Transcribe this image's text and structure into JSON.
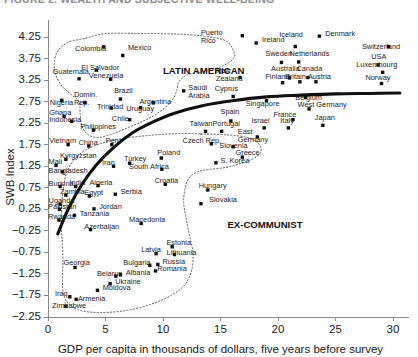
{
  "figure": {
    "cropped_header_text": "FIGURE 2. WEALTH AND SUBJECTIVE WELL-BEING",
    "background_color": "#ffffff",
    "point_color": "#111111",
    "trend_color": "#101010",
    "hull_color": "#5a5a5a"
  },
  "chart_data": {
    "type": "scatter",
    "title": "",
    "xlabel": "GDP per capita in thousands of dollars, five years before survey",
    "ylabel": "SWB Index",
    "xlim": [
      0,
      31
    ],
    "ylim": [
      -2.25,
      4.45
    ],
    "grid": false,
    "legend": "none",
    "xticks": [
      0,
      5,
      10,
      15,
      20,
      25,
      30
    ],
    "xtick_labels": [
      "0",
      "5",
      "10",
      "15",
      "20",
      "25",
      "30"
    ],
    "yticks": [
      4.25,
      3.75,
      3.25,
      2.75,
      2.25,
      1.75,
      1.25,
      0.75,
      0.25,
      -0.25,
      -0.75,
      -1.25,
      -1.75,
      -2.25
    ],
    "ytick_labels": [
      "4.25",
      "3.75",
      "3.25",
      "2.75",
      "2.25",
      "1.75",
      "1.25",
      "0.75",
      "0.25",
      "−0.25",
      "−0.75",
      "−1.25",
      "−1.75",
      "−2.25"
    ],
    "annotations": [
      {
        "text": "LATIN AMERICAN",
        "x": 10.0,
        "y": 3.4
      },
      {
        "text": "EX-COMMUNIST",
        "x": 15.6,
        "y": -0.18
      }
    ],
    "points": [
      {
        "label": "Colombia",
        "x": 4.85,
        "y": 4.02,
        "lx": 2.35,
        "ly": 3.93
      },
      {
        "label": "Mexico",
        "x": 6.5,
        "y": 3.82,
        "lx": 6.95,
        "ly": 3.95
      },
      {
        "label": "Puerto Rico",
        "x": 16.9,
        "y": 4.28,
        "lx": 13.3,
        "ly": 4.3
      },
      {
        "label": "Ireland",
        "x": 18.1,
        "y": 4.11,
        "lx": 18.6,
        "ly": 4.13
      },
      {
        "label": "Iceland",
        "x": 21.5,
        "y": 4.03,
        "lx": 20.1,
        "ly": 4.24
      },
      {
        "label": "Denmark",
        "x": 23.6,
        "y": 4.27,
        "lx": 24.1,
        "ly": 4.28
      },
      {
        "label": "Switzerland",
        "x": 29.6,
        "y": 4.03,
        "lx": 27.3,
        "ly": 3.96
      },
      {
        "label": "Sweden",
        "x": 20.3,
        "y": 3.66,
        "lx": 18.9,
        "ly": 3.8
      },
      {
        "label": "Netherlands",
        "x": 21.8,
        "y": 3.67,
        "lx": 21.0,
        "ly": 3.81
      },
      {
        "label": "USA",
        "x": 28.7,
        "y": 3.6,
        "lx": 28.1,
        "ly": 3.74
      },
      {
        "label": "Luxembourg",
        "x": 29.1,
        "y": 3.43,
        "lx": 26.8,
        "ly": 3.56
      },
      {
        "label": "El Salvador",
        "x": 4.2,
        "y": 3.48,
        "lx": 2.9,
        "ly": 3.48
      },
      {
        "label": "Venezuela",
        "x": 5.45,
        "y": 3.27,
        "lx": 3.55,
        "ly": 3.3
      },
      {
        "label": "Guatemala",
        "x": 2.7,
        "y": 3.28,
        "lx": 0.4,
        "ly": 3.39
      },
      {
        "label": "Australia",
        "x": 21.0,
        "y": 3.3,
        "lx": 19.4,
        "ly": 3.46
      },
      {
        "label": "Canada",
        "x": 22.6,
        "y": 3.31,
        "lx": 21.6,
        "ly": 3.45
      },
      {
        "label": "Britain",
        "x": 21.9,
        "y": 3.21,
        "lx": 20.6,
        "ly": 3.27
      },
      {
        "label": "Austria",
        "x": 23.3,
        "y": 3.21,
        "lx": 22.6,
        "ly": 3.27
      },
      {
        "label": "Finland",
        "x": 20.4,
        "y": 3.19,
        "lx": 18.9,
        "ly": 3.27
      },
      {
        "label": "New Zealand",
        "x": 16.7,
        "y": 3.31,
        "lx": 14.6,
        "ly": 3.42
      },
      {
        "label": "Norway",
        "x": 29.0,
        "y": 3.17,
        "lx": 27.6,
        "ly": 3.25
      },
      {
        "label": "Saudi Arabia",
        "x": 11.8,
        "y": 3.0,
        "lx": 12.2,
        "ly": 3.02
      },
      {
        "label": "Cyprus",
        "x": 16.1,
        "y": 2.87,
        "lx": 14.5,
        "ly": 2.99
      },
      {
        "label": "Belgium",
        "x": 22.4,
        "y": 2.85,
        "lx": 21.5,
        "ly": 2.79
      },
      {
        "label": "Singapore",
        "x": 19.0,
        "y": 2.77,
        "lx": 17.2,
        "ly": 2.65
      },
      {
        "label": "Brazil",
        "x": 6.3,
        "y": 2.81,
        "lx": 5.75,
        "ly": 2.95
      },
      {
        "label": "Nigeria",
        "x": 1.2,
        "y": 2.78,
        "lx": 0.15,
        "ly": 2.68
      },
      {
        "label": "Domin. Rep.",
        "x": 3.2,
        "y": 2.73,
        "lx": 2.25,
        "ly": 2.85
      },
      {
        "label": "Argentina",
        "x": 9.15,
        "y": 2.72,
        "lx": 7.95,
        "ly": 2.69
      },
      {
        "label": "Trinidad",
        "x": 5.5,
        "y": 2.6,
        "lx": 4.25,
        "ly": 2.57
      },
      {
        "label": "Uruguay",
        "x": 8.05,
        "y": 2.61,
        "lx": 6.8,
        "ly": 2.54
      },
      {
        "label": "West Germany",
        "x": 22.7,
        "y": 2.58,
        "lx": 21.7,
        "ly": 2.62
      },
      {
        "label": "Ghana",
        "x": 1.4,
        "y": 2.41,
        "lx": 0.1,
        "ly": 2.43
      },
      {
        "label": "Indonesia",
        "x": 2.05,
        "y": 2.29,
        "lx": 0.1,
        "ly": 2.28
      },
      {
        "label": "Chile",
        "x": 7.1,
        "y": 2.33,
        "lx": 5.55,
        "ly": 2.3
      },
      {
        "label": "France",
        "x": 21.3,
        "y": 2.33,
        "lx": 19.6,
        "ly": 2.4
      },
      {
        "label": "Spain",
        "x": 15.9,
        "y": 2.3,
        "lx": 15.0,
        "ly": 2.47
      },
      {
        "label": "Japan",
        "x": 23.9,
        "y": 2.2,
        "lx": 23.2,
        "ly": 2.33
      },
      {
        "label": "Israel",
        "x": 18.8,
        "y": 2.14,
        "lx": 17.7,
        "ly": 2.25
      },
      {
        "label": "Italy",
        "x": 20.9,
        "y": 2.14,
        "lx": 20.2,
        "ly": 2.25
      },
      {
        "label": "Philippines",
        "x": 3.95,
        "y": 2.09,
        "lx": 2.8,
        "ly": 2.12
      },
      {
        "label": "Taiwan",
        "x": 13.7,
        "y": 2.06,
        "lx": 12.3,
        "ly": 2.18
      },
      {
        "label": "Portugal",
        "x": 15.1,
        "y": 2.06,
        "lx": 14.3,
        "ly": 2.18
      },
      {
        "label": "East Germany",
        "x": 18.2,
        "y": 1.93,
        "lx": 16.5,
        "ly": 1.99
      },
      {
        "label": "Vietnam",
        "x": 1.75,
        "y": 1.75,
        "lx": 0.1,
        "ly": 1.78
      },
      {
        "label": "China",
        "x": 3.55,
        "y": 1.72,
        "lx": 2.65,
        "ly": 1.75
      },
      {
        "label": "Peru",
        "x": 5.55,
        "y": 1.75,
        "lx": 5.0,
        "ly": 1.79
      },
      {
        "label": "Czech Rep.",
        "x": 14.2,
        "y": 1.77,
        "lx": 11.7,
        "ly": 1.8
      },
      {
        "label": "Slovenia",
        "x": 16.1,
        "y": 1.7,
        "lx": 14.9,
        "ly": 1.67
      },
      {
        "label": "Kyrgyzstan",
        "x": 1.55,
        "y": 1.41,
        "lx": 1.05,
        "ly": 1.44
      },
      {
        "label": "Poland",
        "x": 9.85,
        "y": 1.44,
        "lx": 9.5,
        "ly": 1.5
      },
      {
        "label": "Greece",
        "x": 16.9,
        "y": 1.46,
        "lx": 16.3,
        "ly": 1.5
      },
      {
        "label": "Mali",
        "x": 0.7,
        "y": 1.27,
        "lx": 0.05,
        "ly": 1.3
      },
      {
        "label": "Iran",
        "x": 5.7,
        "y": 1.25,
        "lx": 4.7,
        "ly": 1.28
      },
      {
        "label": "Turkey",
        "x": 7.1,
        "y": 1.32,
        "lx": 6.6,
        "ly": 1.36
      },
      {
        "label": "S. Korea",
        "x": 14.6,
        "y": 1.33,
        "lx": 15.0,
        "ly": 1.33
      },
      {
        "label": "South Africa",
        "x": 9.9,
        "y": 1.18,
        "lx": 7.05,
        "ly": 1.19
      },
      {
        "label": "Bangladesh",
        "x": 1.25,
        "y": 1.12,
        "lx": 0.05,
        "ly": 1.1
      },
      {
        "label": "Burkina",
        "x": 1.05,
        "y": 0.78,
        "lx": 0.05,
        "ly": 0.8
      },
      {
        "label": "India",
        "x": 2.4,
        "y": 0.78,
        "lx": 1.85,
        "ly": 0.81
      },
      {
        "label": "Algeria",
        "x": 4.35,
        "y": 0.8,
        "lx": 3.6,
        "ly": 0.82
      },
      {
        "label": "Croatia",
        "x": 10.2,
        "y": 0.83,
        "lx": 9.25,
        "ly": 0.87
      },
      {
        "label": "Hungary",
        "x": 13.9,
        "y": 0.7,
        "lx": 13.1,
        "ly": 0.74
      },
      {
        "label": "Zambia",
        "x": 1.55,
        "y": 0.58,
        "lx": 1.05,
        "ly": 0.61
      },
      {
        "label": "Egypt",
        "x": 3.6,
        "y": 0.56,
        "lx": 3.15,
        "ly": 0.59
      },
      {
        "label": "Serbia",
        "x": 5.85,
        "y": 0.6,
        "lx": 6.3,
        "ly": 0.6
      },
      {
        "label": "Uganda",
        "x": 1.05,
        "y": 0.37,
        "lx": 0.05,
        "ly": 0.4
      },
      {
        "label": "Slovakia",
        "x": 13.3,
        "y": 0.38,
        "lx": 14.0,
        "ly": 0.42
      },
      {
        "label": "Pakistan",
        "x": 1.0,
        "y": 0.25,
        "lx": 0.0,
        "ly": 0.25
      },
      {
        "label": "Jordan",
        "x": 4.0,
        "y": 0.26,
        "lx": 4.45,
        "ly": 0.26
      },
      {
        "label": "Tanzania",
        "x": 2.3,
        "y": 0.11,
        "lx": 2.75,
        "ly": 0.1
      },
      {
        "label": "Rwanda",
        "x": 0.95,
        "y": 0.0,
        "lx": 0.0,
        "ly": 0.02
      },
      {
        "label": "Macedonia",
        "x": 8.1,
        "y": -0.08,
        "lx": 7.05,
        "ly": -0.04
      },
      {
        "label": "Azerbaijan",
        "x": 3.7,
        "y": -0.22,
        "lx": 3.15,
        "ly": -0.2
      },
      {
        "label": "Estonia",
        "x": 10.8,
        "y": -0.62,
        "lx": 10.3,
        "ly": -0.58
      },
      {
        "label": "Latvia",
        "x": 9.4,
        "y": -0.78,
        "lx": 8.1,
        "ly": -0.73
      },
      {
        "label": "Lithuania",
        "x": 11.0,
        "y": -0.8,
        "lx": 10.3,
        "ly": -0.82
      },
      {
        "label": "Georgia",
        "x": 2.35,
        "y": -1.1,
        "lx": 1.35,
        "ly": -1.05
      },
      {
        "label": "Bulgaria",
        "x": 8.85,
        "y": -1.05,
        "lx": 6.55,
        "ly": -1.05
      },
      {
        "label": "Russia",
        "x": 9.55,
        "y": -1.03,
        "lx": 9.95,
        "ly": -1.03
      },
      {
        "label": "Romania",
        "x": 9.35,
        "y": -1.18,
        "lx": 9.5,
        "ly": -1.18
      },
      {
        "label": "Belarus",
        "x": 5.9,
        "y": -1.3,
        "lx": 4.25,
        "ly": -1.3
      },
      {
        "label": "Albania",
        "x": 6.3,
        "y": -1.27,
        "lx": 6.75,
        "ly": -1.27
      },
      {
        "label": "Ukraine",
        "x": 5.4,
        "y": -1.48,
        "lx": 5.85,
        "ly": -1.48
      },
      {
        "label": "Moldova",
        "x": 4.3,
        "y": -1.63,
        "lx": 4.75,
        "ly": -1.62
      },
      {
        "label": "Iraq",
        "x": 1.9,
        "y": -1.78,
        "lx": 0.6,
        "ly": -1.76
      },
      {
        "label": "Armenia",
        "x": 2.45,
        "y": -1.84,
        "lx": 2.6,
        "ly": -1.87
      },
      {
        "label": "Zimbabwe",
        "x": 1.55,
        "y": -2.0,
        "lx": 0.35,
        "ly": -2.04
      }
    ],
    "trend_curve": {
      "description": "fitted logarithmic trend of SWB on GDP per capita",
      "points": [
        {
          "x": 0.85,
          "y": -0.32
        },
        {
          "x": 1.8,
          "y": 0.28
        },
        {
          "x": 3.0,
          "y": 0.85
        },
        {
          "x": 4.2,
          "y": 1.28
        },
        {
          "x": 5.6,
          "y": 1.66
        },
        {
          "x": 7.2,
          "y": 2.0
        },
        {
          "x": 9.0,
          "y": 2.26
        },
        {
          "x": 11.0,
          "y": 2.48
        },
        {
          "x": 13.5,
          "y": 2.66
        },
        {
          "x": 16.0,
          "y": 2.77
        },
        {
          "x": 19.0,
          "y": 2.86
        },
        {
          "x": 22.0,
          "y": 2.9
        },
        {
          "x": 25.0,
          "y": 2.93
        },
        {
          "x": 28.0,
          "y": 2.94
        },
        {
          "x": 30.6,
          "y": 2.95
        }
      ]
    },
    "hulls": [
      {
        "name": "latin-american",
        "vertices": [
          [
            3.3,
            4.22
          ],
          [
            5.0,
            4.33
          ],
          [
            8.0,
            4.33
          ],
          [
            11.0,
            4.32
          ],
          [
            13.2,
            4.28
          ],
          [
            15.3,
            4.18
          ],
          [
            16.0,
            4.0
          ],
          [
            16.2,
            3.78
          ],
          [
            15.2,
            3.58
          ],
          [
            13.6,
            3.45
          ],
          [
            12.2,
            3.38
          ],
          [
            11.4,
            3.22
          ],
          [
            11.2,
            3.02
          ],
          [
            10.9,
            2.82
          ],
          [
            10.2,
            2.62
          ],
          [
            9.3,
            2.44
          ],
          [
            8.3,
            2.3
          ],
          [
            7.0,
            2.15
          ],
          [
            5.6,
            2.0
          ],
          [
            4.4,
            1.92
          ],
          [
            3.5,
            1.98
          ],
          [
            2.95,
            2.18
          ],
          [
            2.8,
            2.46
          ],
          [
            2.7,
            2.74
          ],
          [
            2.0,
            2.92
          ],
          [
            1.25,
            3.1
          ],
          [
            0.7,
            3.35
          ],
          [
            0.55,
            3.62
          ],
          [
            0.8,
            3.9
          ],
          [
            1.7,
            4.12
          ],
          [
            3.3,
            4.22
          ]
        ]
      },
      {
        "name": "ex-communist",
        "vertices": [
          [
            13.3,
            2.0
          ],
          [
            15.5,
            1.98
          ],
          [
            17.3,
            1.92
          ],
          [
            18.3,
            1.78
          ],
          [
            18.5,
            1.58
          ],
          [
            17.8,
            1.42
          ],
          [
            16.6,
            1.3
          ],
          [
            15.4,
            1.22
          ],
          [
            14.2,
            1.18
          ],
          [
            13.0,
            1.12
          ],
          [
            12.2,
            0.95
          ],
          [
            11.9,
            0.7
          ],
          [
            11.8,
            0.4
          ],
          [
            12.0,
            0.05
          ],
          [
            12.3,
            -0.35
          ],
          [
            12.6,
            -0.75
          ],
          [
            12.5,
            -1.15
          ],
          [
            11.9,
            -1.5
          ],
          [
            10.7,
            -1.75
          ],
          [
            9.0,
            -1.95
          ],
          [
            7.2,
            -2.08
          ],
          [
            5.4,
            -2.14
          ],
          [
            3.8,
            -2.14
          ],
          [
            2.6,
            -2.08
          ],
          [
            1.8,
            -1.95
          ],
          [
            1.35,
            -1.72
          ],
          [
            1.25,
            -1.4
          ],
          [
            1.3,
            -1.0
          ],
          [
            1.25,
            -0.55
          ],
          [
            1.15,
            -0.1
          ],
          [
            1.2,
            0.35
          ],
          [
            1.35,
            0.78
          ],
          [
            1.65,
            1.12
          ],
          [
            2.2,
            1.38
          ],
          [
            3.0,
            1.58
          ],
          [
            4.0,
            1.72
          ],
          [
            5.2,
            1.82
          ],
          [
            6.6,
            1.9
          ],
          [
            8.2,
            1.95
          ],
          [
            10.0,
            1.99
          ],
          [
            11.7,
            2.01
          ],
          [
            13.3,
            2.0
          ]
        ]
      }
    ]
  }
}
